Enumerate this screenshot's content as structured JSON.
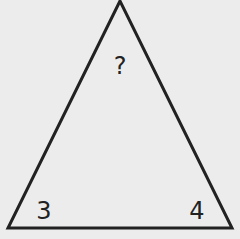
{
  "diagram": {
    "shape": "triangle",
    "vertices": {
      "apex": [
        120,
        1
      ],
      "bottom_left": [
        8,
        228
      ],
      "bottom_right": [
        232,
        228
      ]
    },
    "stroke_color": "#222222",
    "background_color": "#ececec",
    "labels": {
      "top": {
        "text": "?",
        "x": 120,
        "y": 66
      },
      "bottom_left": {
        "text": "3",
        "x": 44,
        "y": 211
      },
      "bottom_right": {
        "text": "4",
        "x": 197,
        "y": 211
      }
    }
  }
}
